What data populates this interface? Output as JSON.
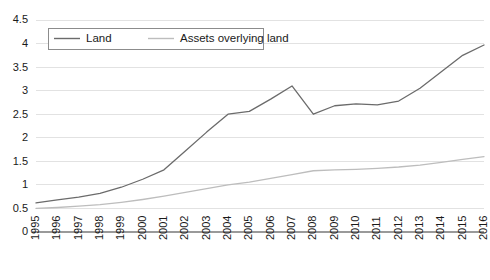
{
  "chart_data": {
    "type": "line",
    "title": "",
    "subtitle": "",
    "xlabel": "",
    "ylabel": "",
    "grid": true,
    "legend_position": "top-left",
    "ylim": [
      0,
      4.5
    ],
    "ytick_step": 0.5,
    "ytick_labels": [
      "0",
      "0.5",
      "1",
      "1.5",
      "2",
      "2.5",
      "3",
      "3.5",
      "4",
      "4.5"
    ],
    "ytick_values": [
      0,
      0.5,
      1,
      1.5,
      2,
      2.5,
      3,
      3.5,
      4,
      4.5
    ],
    "categories": [
      "1995",
      "1996",
      "1997",
      "1998",
      "1999",
      "2000",
      "2001",
      "2002",
      "2003",
      "2004",
      "2005",
      "2006",
      "2007",
      "2008",
      "2009",
      "2010",
      "2011",
      "2012",
      "2013",
      "2014",
      "2015",
      "2016"
    ],
    "x": [
      1995,
      1996,
      1997,
      1998,
      1999,
      2000,
      2001,
      2002,
      2003,
      2004,
      2005,
      2006,
      2007,
      2008,
      2009,
      2010,
      2011,
      2012,
      2013,
      2014,
      2015,
      2016
    ],
    "series": [
      {
        "name": "Land",
        "color": "#6b6b6b",
        "values": [
          0.62,
          0.68,
          0.74,
          0.82,
          0.95,
          1.12,
          1.32,
          1.72,
          2.12,
          2.5,
          2.56,
          2.82,
          3.1,
          2.5,
          2.68,
          2.72,
          2.7,
          2.78,
          3.05,
          3.4,
          3.75,
          3.97
        ]
      },
      {
        "name": "Assets overlying land",
        "color": "#bdbdbd",
        "values": [
          0.5,
          0.52,
          0.55,
          0.58,
          0.63,
          0.69,
          0.76,
          0.84,
          0.92,
          1.0,
          1.06,
          1.14,
          1.22,
          1.3,
          1.32,
          1.33,
          1.35,
          1.38,
          1.42,
          1.48,
          1.54,
          1.6
        ]
      }
    ]
  },
  "legend": {
    "entries": [
      {
        "label": "Land"
      },
      {
        "label": "Assets overlying land"
      }
    ]
  },
  "colors": {
    "series_land": "#6b6b6b",
    "series_assets": "#bdbdbd",
    "gridline": "#e2e2e2",
    "axis": "#9a9a9a",
    "text": "#1a1a1a",
    "legend_border": "#8c8c8c",
    "background": "#ffffff"
  }
}
